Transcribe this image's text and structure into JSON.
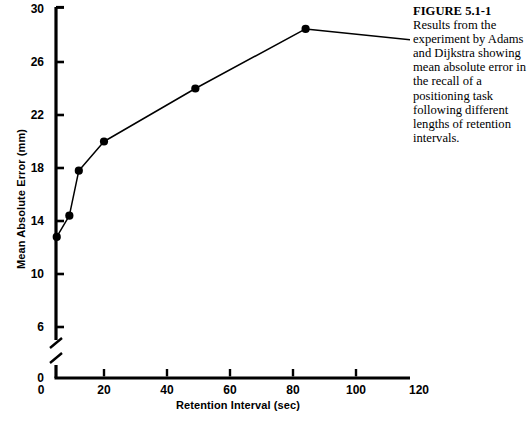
{
  "figure": {
    "caption_title": "FIGURE 5.1-1",
    "caption_lines": [
      "Results from the",
      "experiment by Adams",
      "and Dijkstra showing",
      "mean absolute error in",
      "the recall of a",
      "positioning task",
      "following different",
      "lengths of retention",
      "intervals."
    ]
  },
  "chart_data": {
    "type": "line",
    "title": "",
    "xlabel": "Retention Interval (sec)",
    "ylabel": "Mean Absolute Error (mm)",
    "xlim": [
      0,
      120
    ],
    "ylim": [
      6,
      30
    ],
    "y_axis_break": true,
    "y_break_from": 0,
    "y_break_to": 6,
    "grid": false,
    "legend": "none",
    "marker": "filled-circle",
    "xticks": [
      0,
      20,
      40,
      60,
      80,
      100,
      120
    ],
    "xtick_labels": [
      "0",
      "20",
      "40",
      "60",
      "80",
      "100",
      "120"
    ],
    "yticks": [
      0,
      6,
      10,
      14,
      18,
      22,
      26,
      30
    ],
    "ytick_labels": [
      "0",
      "6",
      "10",
      "14",
      "18",
      "22",
      "26",
      "30"
    ],
    "series": [
      {
        "name": "Mean absolute error",
        "x": [
          5,
          9,
          12,
          20,
          49,
          84,
          120
        ],
        "values": [
          12.8,
          14.4,
          17.8,
          20.0,
          24.0,
          28.5,
          27.6
        ]
      }
    ]
  }
}
